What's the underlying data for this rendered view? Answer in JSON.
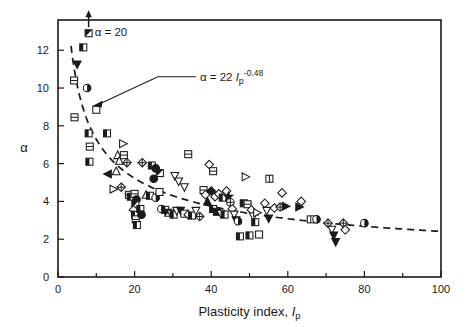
{
  "figure": {
    "background": "#ffffff",
    "ink_color": "#1a1a1a"
  },
  "chart_data": {
    "type": "scatter",
    "title": "",
    "xlabel": "Plasticity index, Ip",
    "xlabel_main": "Plasticity index, ",
    "xlabel_symbol": "I",
    "xlabel_subscript": "p",
    "ylabel": "α",
    "xlim": [
      0,
      100
    ],
    "ylim": [
      0,
      13.6
    ],
    "grid": false,
    "legend": "none",
    "x_ticks_major": [
      0,
      20,
      40,
      60,
      80,
      100
    ],
    "x_ticks_minor": [
      10,
      30,
      50,
      70,
      90
    ],
    "y_ticks_major": [
      0,
      2,
      4,
      6,
      8,
      10,
      12
    ],
    "x_tick_labels": [
      "0",
      "20",
      "40",
      "60",
      "80",
      "100"
    ],
    "y_tick_labels": [
      "0",
      "2",
      "4",
      "6",
      "8",
      "10",
      "12"
    ],
    "annotations": [
      {
        "name": "alpha-20-label",
        "text": "α = 20",
        "x": 8.0,
        "y": 12.9,
        "arrow": "up",
        "note": "off-scale datum at alpha = 20"
      },
      {
        "name": "equation-label",
        "text_full": "α = 22 Ip-0.48",
        "text_prefix": "α = 22 ",
        "text_symbol": "I",
        "text_subscript": "p",
        "text_exponent": "-0.48",
        "x": 36.0,
        "y": 10.6,
        "points_to_x": 9.0,
        "points_to_y": 9.1
      }
    ],
    "trend_curve": {
      "name": "power-law-fit",
      "equation": "alpha = 22 * Ip^-0.48",
      "coefficient": 22,
      "exponent": -0.48,
      "style": "dashed",
      "x_start": 3.4,
      "x_end": 100,
      "tail_value": 2.3
    },
    "series": [
      {
        "name": "measured-data",
        "marker_note": "mixed symbol shapes: open/filled/half squares, triangles, circles, diamonds, stars",
        "points": [
          [
            6.6,
            12.15,
            "square-half"
          ],
          [
            5.0,
            11.25,
            "triangle-down-filled"
          ],
          [
            4.2,
            10.4,
            "square-split"
          ],
          [
            7.6,
            10.0,
            "circle-half"
          ],
          [
            10.0,
            8.85,
            "square-open"
          ],
          [
            4.3,
            8.45,
            "square-split"
          ],
          [
            8.0,
            7.6,
            "square-half"
          ],
          [
            12.8,
            7.6,
            "square-half"
          ],
          [
            8.3,
            6.9,
            "square-split"
          ],
          [
            8.2,
            6.1,
            "square-half"
          ],
          [
            17.0,
            7.05,
            "triangle-right-open"
          ],
          [
            15.6,
            6.45,
            "triangle-up-open"
          ],
          [
            17.2,
            6.45,
            "square-split"
          ],
          [
            16.0,
            6.15,
            "triangle-up-open"
          ],
          [
            18.0,
            6.05,
            "diamond-cross"
          ],
          [
            22.0,
            6.05,
            "diamond-cross"
          ],
          [
            13.0,
            5.45,
            "triangle-left-filled"
          ],
          [
            15.2,
            5.6,
            "triangle-up-open"
          ],
          [
            24.5,
            5.9,
            "square-half"
          ],
          [
            25.5,
            5.75,
            "circle-filled"
          ],
          [
            26.6,
            5.5,
            "square-d-half"
          ],
          [
            25.0,
            5.2,
            "circle-filled"
          ],
          [
            34.0,
            6.5,
            "square-split"
          ],
          [
            39.5,
            5.95,
            "diamond-open"
          ],
          [
            40.5,
            5.6,
            "square-split"
          ],
          [
            30.5,
            5.35,
            "triangle-down-open"
          ],
          [
            31.5,
            5.05,
            "triangle-down-open"
          ],
          [
            33.0,
            4.75,
            "triangle-down-open"
          ],
          [
            14.5,
            4.65,
            "triangle-d-open"
          ],
          [
            16.5,
            4.75,
            "diamond-cross"
          ],
          [
            18.5,
            4.35,
            "square-split"
          ],
          [
            19.0,
            4.25,
            "square-half"
          ],
          [
            20.0,
            4.4,
            "square-split"
          ],
          [
            20.5,
            4.1,
            "circle-filled"
          ],
          [
            20.2,
            3.85,
            "square-d-half"
          ],
          [
            19.7,
            3.55,
            "diamond-open"
          ],
          [
            20.1,
            3.3,
            "square-half"
          ],
          [
            20.3,
            3.05,
            "square-split"
          ],
          [
            20.6,
            2.75,
            "square-half"
          ],
          [
            21.5,
            3.6,
            "square-half"
          ],
          [
            21.8,
            3.3,
            "circle-filled"
          ],
          [
            23.0,
            4.35,
            "triangle-up-open"
          ],
          [
            24.0,
            4.3,
            "square-half"
          ],
          [
            25.5,
            4.2,
            "circle-half"
          ],
          [
            26.5,
            4.5,
            "square-open"
          ],
          [
            27.0,
            3.6,
            "circle-half"
          ],
          [
            28.0,
            3.55,
            "square-half"
          ],
          [
            28.8,
            3.4,
            "square-d-half"
          ],
          [
            29.5,
            3.35,
            "triangle-down-open"
          ],
          [
            30.2,
            3.3,
            "square-half"
          ],
          [
            31.0,
            3.5,
            "triangle-down-open"
          ],
          [
            32.0,
            3.5,
            "triangle-down-filled"
          ],
          [
            33.0,
            3.35,
            "square-open"
          ],
          [
            34.0,
            3.3,
            "diamond-open"
          ],
          [
            35.0,
            3.25,
            "square-half"
          ],
          [
            36.0,
            3.5,
            "triangle-down-open"
          ],
          [
            37.0,
            3.2,
            "diamond-cross"
          ],
          [
            38.0,
            4.6,
            "square-split"
          ],
          [
            38.5,
            4.35,
            "diamond-open"
          ],
          [
            39.0,
            4.0,
            "triangle-up-filled"
          ],
          [
            40.0,
            4.55,
            "diamond-filled"
          ],
          [
            41.0,
            4.25,
            "diamond-open"
          ],
          [
            42.0,
            4.4,
            "diamond-open"
          ],
          [
            43.0,
            4.2,
            "square-half"
          ],
          [
            44.0,
            4.55,
            "diamond-open"
          ],
          [
            44.5,
            4.25,
            "star-filled"
          ],
          [
            45.0,
            3.95,
            "circle-cross"
          ],
          [
            45.5,
            3.6,
            "diamond-open"
          ],
          [
            46.0,
            3.3,
            "triangle-down-open"
          ],
          [
            46.5,
            3.0,
            "triangle-down-filled"
          ],
          [
            40.5,
            3.6,
            "square-half"
          ],
          [
            41.5,
            3.45,
            "square-filled"
          ],
          [
            42.5,
            3.35,
            "triangle-down-open"
          ],
          [
            43.5,
            3.3,
            "square-half"
          ],
          [
            47.0,
            2.95,
            "circle-half"
          ],
          [
            47.5,
            2.15,
            "square-half"
          ],
          [
            50.0,
            2.2,
            "square-half"
          ],
          [
            52.5,
            2.25,
            "square-open"
          ],
          [
            48.5,
            3.9,
            "square-half"
          ],
          [
            49.5,
            3.85,
            "square-split"
          ],
          [
            50.5,
            3.55,
            "diamond-open"
          ],
          [
            51.0,
            3.2,
            "triangle-down-open"
          ],
          [
            51.5,
            2.9,
            "square-half"
          ],
          [
            52.0,
            3.4,
            "triangle-right-open"
          ],
          [
            49.0,
            5.3,
            "triangle-right-open"
          ],
          [
            54.0,
            3.9,
            "diamond-open"
          ],
          [
            54.5,
            3.5,
            "triangle-down-open"
          ],
          [
            55.0,
            3.1,
            "triangle-down-filled"
          ],
          [
            55.2,
            5.2,
            "square-h-split"
          ],
          [
            56.5,
            3.65,
            "diamond-open"
          ],
          [
            58.5,
            4.45,
            "diamond-open"
          ],
          [
            58.0,
            3.7,
            "diamond-cross"
          ],
          [
            59.5,
            3.75,
            "triangle-right-filled"
          ],
          [
            63.5,
            4.0,
            "diamond-open"
          ],
          [
            63.0,
            3.7,
            "triangle-right-filled"
          ],
          [
            66.0,
            3.05,
            "square-h-split"
          ],
          [
            67.5,
            3.05,
            "circle-half"
          ],
          [
            70.5,
            2.85,
            "diamond-cross"
          ],
          [
            71.5,
            2.5,
            "triangle-down-open"
          ],
          [
            72.0,
            2.2,
            "triangle-down-filled"
          ],
          [
            72.5,
            1.85,
            "triangle-down-filled"
          ],
          [
            74.5,
            2.85,
            "diamond-cross"
          ],
          [
            75.0,
            2.5,
            "diamond-open"
          ],
          [
            80.0,
            2.85,
            "circle-half"
          ]
        ]
      }
    ]
  }
}
